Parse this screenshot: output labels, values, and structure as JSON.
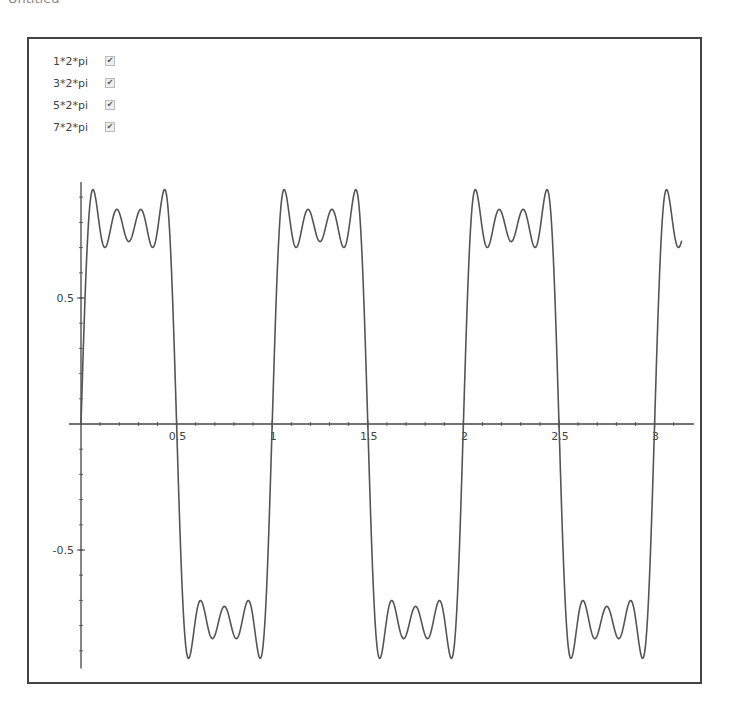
{
  "caption": "Untitled",
  "legend": [
    {
      "label": "1*2*pi",
      "checked": true
    },
    {
      "label": "3*2*pi",
      "checked": true
    },
    {
      "label": "5*2*pi",
      "checked": true
    },
    {
      "label": "7*2*pi",
      "checked": true
    }
  ],
  "colors": {
    "curve": "#555555",
    "axis": "#444444",
    "frame": "#444444"
  },
  "chart_data": {
    "type": "line",
    "title": "",
    "xlabel": "",
    "ylabel": "",
    "function": "sum_{k in [1,3,5,7]} sin(k*2*pi*x)/k",
    "harmonics": [
      1,
      3,
      5,
      7
    ],
    "xlim": [
      0,
      3.14159
    ],
    "ylim": [
      -0.97,
      0.96
    ],
    "x_ticks": [
      0.5,
      1,
      1.5,
      2,
      2.5,
      3
    ],
    "x_tick_labels": [
      "0.5",
      "1",
      "1.5",
      "2",
      "2.5",
      "3"
    ],
    "y_ticks": [
      0.5,
      -0.5
    ],
    "y_tick_labels": [
      "0.5",
      "-0.5"
    ],
    "grid": false,
    "legend_position": "top-left",
    "series": [
      {
        "name": "1*2*pi + 3*2*pi + 5*2*pi + 7*2*pi",
        "sample_x": [
          0,
          0.03,
          0.125,
          0.25,
          0.375,
          0.47,
          0.5,
          0.53,
          0.75,
          0.97,
          1.0,
          1.25,
          1.5,
          1.75,
          2.0,
          2.25,
          2.5,
          2.75,
          3.0,
          3.14
        ],
        "sample_y": [
          0,
          0.91,
          0.71,
          0.7,
          0.71,
          0.91,
          0,
          -0.91,
          -0.7,
          -0.91,
          0,
          0.7,
          0,
          -0.7,
          0,
          0.7,
          0,
          -0.7,
          0,
          0.72
        ]
      }
    ]
  }
}
